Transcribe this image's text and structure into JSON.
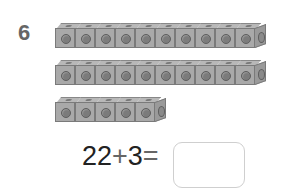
{
  "question": {
    "number": "6",
    "rows": [
      {
        "cubes": 10,
        "top": 23
      },
      {
        "cubes": 10,
        "top": 60
      },
      {
        "cubes": 5,
        "top": 97
      }
    ],
    "equation": {
      "left_operand": "22",
      "operator": "+",
      "right_operand": "3",
      "equals": "=",
      "answer": ""
    }
  },
  "colors": {
    "cube_face": "#a9a9a9",
    "cube_top": "#b8b8b8",
    "number": "#666666",
    "text": "#222222",
    "box_border": "#cfcfcf"
  }
}
